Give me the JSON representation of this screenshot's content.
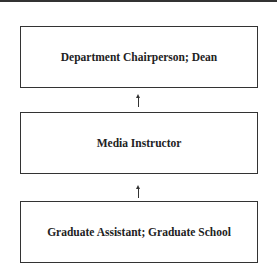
{
  "diagram": {
    "type": "hierarchy",
    "boxes": [
      {
        "label": "Department Chairperson; Dean"
      },
      {
        "label": "Media Instructor"
      },
      {
        "label": "Graduate Assistant; Graduate School"
      }
    ],
    "connectors": [
      {
        "from": "Media Instructor",
        "to": "Department Chairperson; Dean",
        "style": "arrow-up"
      },
      {
        "from": "Graduate Assistant; Graduate School",
        "to": "Media Instructor",
        "style": "arrow-up"
      }
    ]
  }
}
